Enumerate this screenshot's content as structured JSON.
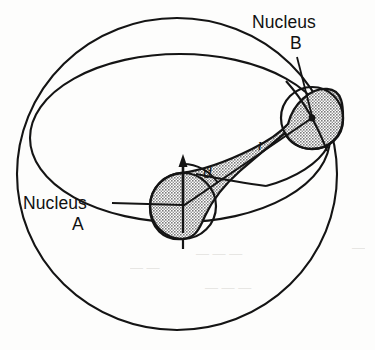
{
  "figure": {
    "background_color": "#fdfdfc",
    "line_color": "#141414",
    "shade_fill": "#a9a9a9",
    "shade_fill_light": "#b4b4b4"
  },
  "labels": {
    "nucleus_b_line1": "Nucleus",
    "nucleus_b_line2": "B",
    "nucleus_a_line1": "Nucleus",
    "nucleus_a_line2": "A",
    "radius_symbol": "r",
    "angle_symbol": "ϑ"
  },
  "geometry": {
    "sphere": {
      "cx": 177,
      "cy": 174,
      "rx": 160,
      "ry": 156
    },
    "equator_ellipse": {
      "cx": 180,
      "cy": 138,
      "rx": 150,
      "ry": 84
    },
    "nucleus_a": {
      "cx": 183,
      "cy": 206,
      "r": 33,
      "label": "A"
    },
    "nucleus_b": {
      "cx": 312,
      "cy": 118,
      "r": 31,
      "label": "B"
    },
    "internuclear_axis": {
      "from_x": 183,
      "from_y": 206,
      "to_x": 312,
      "to_y": 118,
      "label": "r"
    },
    "polar_axis_arrow": {
      "x": 183,
      "y_top": 158,
      "y_bottom": 206,
      "direction": "up"
    },
    "dashed_axis_below": {
      "x": 183,
      "y_top": 206,
      "y_bottom": 248
    },
    "angle_arc": {
      "center_x": 183,
      "center_y": 206,
      "radius": 42,
      "from_deg": 90,
      "to_deg": 34,
      "label": "ϑ"
    },
    "leader_nucleus_a": {
      "from_x": 118,
      "from_y": 203,
      "to_x": 183,
      "to_y": 205
    },
    "leader_nucleus_b": {
      "from_x": 297,
      "from_y": 56,
      "to_x": 312,
      "to_y": 117
    }
  },
  "ghost_marks": [
    {
      "text": "— — —",
      "x": 196,
      "y": 258
    },
    {
      "text": "— —",
      "x": 130,
      "y": 272
    },
    {
      "text": "— — —",
      "x": 205,
      "y": 292
    },
    {
      "text": "—",
      "x": 352,
      "y": 252
    }
  ]
}
